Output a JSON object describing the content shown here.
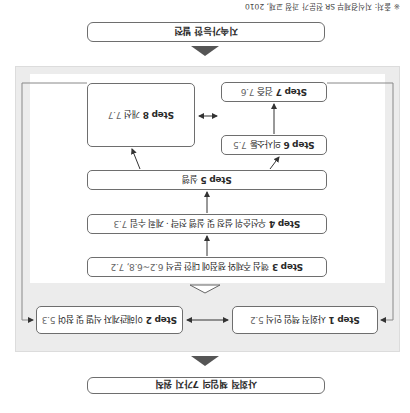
{
  "diagram": {
    "orientation": "rotated 180°",
    "top_input": "사회적 책임의 7가지 원칙",
    "bottom_output": "지속가능한 발전",
    "steps": [
      {
        "step": "Step 1",
        "label": "사회적 책임 인식",
        "ref": "5.2"
      },
      {
        "step": "Step 2",
        "label": "이해관계자 식별 및 참여",
        "ref": "5.3"
      },
      {
        "step": "Step 3",
        "label": "핵심 주제와 쟁점에 대한 분석",
        "ref": "6.2~6.8, 7.2"
      },
      {
        "step": "Step 4",
        "label": "우선순위 설정 및 실행 전략 · 계획 수립",
        "ref": "7.3"
      },
      {
        "step": "Step 5",
        "label": "실행",
        "ref": ""
      },
      {
        "step": "Step 6",
        "label": "의사소통",
        "ref": "7.5"
      },
      {
        "step": "Step 7",
        "label": "검증",
        "ref": "7.6"
      },
      {
        "step": "Step 8",
        "label": "개선",
        "ref": "7.7"
      }
    ],
    "source_note": "※ 출처: 지식경제부 SR 전문가 과정 교재, 2010"
  },
  "colors": {
    "frame": "#ececec",
    "box_border": "#6e6e6e",
    "arrow": "#333333",
    "triangle": "#555555"
  }
}
